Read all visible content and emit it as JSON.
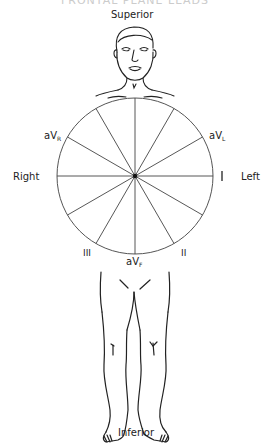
{
  "diagram": {
    "title_partial": "FRONTAL PLANE LEADS",
    "directions": {
      "superior": "Superior",
      "inferior": "Inferior",
      "right": "Right",
      "left": "Left"
    },
    "leads": {
      "I": "I",
      "II": "II",
      "III": "III",
      "aVR_base": "aV",
      "aVR_sub": "R",
      "aVL_base": "aV",
      "aVL_sub": "L",
      "aVF_base": "aV",
      "aVF_sub": "F"
    },
    "hexaxial": {
      "center": [
        135,
        176
      ],
      "radius": 78,
      "spoke_angles_deg": [
        0,
        30,
        60,
        90,
        120,
        150,
        180,
        210,
        240,
        270,
        300,
        330
      ]
    },
    "colors": {
      "line": "#222222",
      "circle": "#555555",
      "background": "#ffffff"
    }
  }
}
